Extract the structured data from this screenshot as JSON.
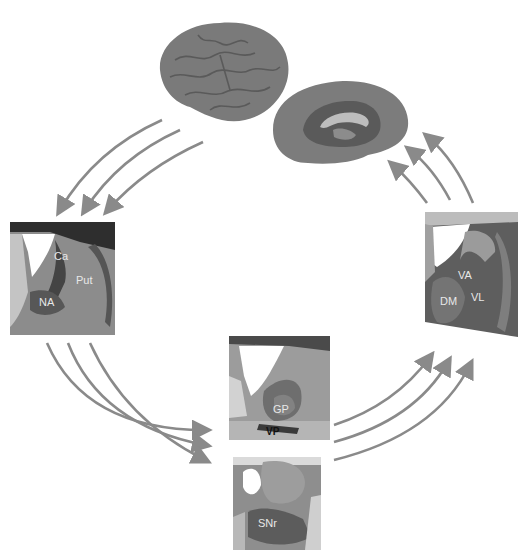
{
  "figure": {
    "type": "basal ganglia-thalamocortical loop diagram",
    "background": "#ffffff",
    "arrow_color": "#8a8a8a"
  },
  "nodes": {
    "cortex_lateral": {
      "name": "lateral cortex view"
    },
    "cortex_medial": {
      "name": "medial cortex view"
    },
    "striatum": {
      "labels": {
        "caudate": "Ca",
        "putamen": "Put",
        "nucleus_accumbens": "NA"
      }
    },
    "pallidum": {
      "labels": {
        "globus_pallidus": "GP",
        "ventral_pallidum": "VP"
      }
    },
    "nigra": {
      "labels": {
        "substantia_nigra": "SNr"
      }
    },
    "thalamus": {
      "labels": {
        "ventral_anterior": "VA",
        "ventral_lateral": "VL",
        "dorsomedial": "DM"
      }
    }
  },
  "connections": [
    {
      "from": "cortex",
      "to": "striatum",
      "count": 3
    },
    {
      "from": "striatum",
      "to": "pallidum/nigra",
      "count": 3
    },
    {
      "from": "pallidum/nigra",
      "to": "thalamus",
      "count": 3
    },
    {
      "from": "thalamus",
      "to": "cortex",
      "count": 3
    }
  ]
}
